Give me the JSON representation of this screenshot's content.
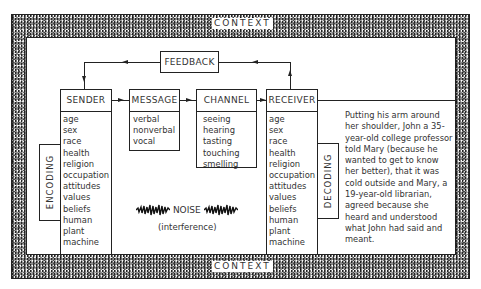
{
  "context": {
    "top_label": "CONTEXT",
    "bottom_label": "CONTEXT"
  },
  "feedback": {
    "label": "FEEDBACK"
  },
  "sender": {
    "label": "SENDER",
    "items": [
      "age",
      "sex",
      "race",
      "health",
      "religion",
      "occupation",
      "attitudes",
      "values",
      "beliefs",
      "human",
      "plant",
      "machine"
    ]
  },
  "message": {
    "label": "MESSAGE",
    "items": [
      "verbal",
      "nonverbal",
      "vocal"
    ]
  },
  "channel": {
    "label": "CHANNEL",
    "items": [
      "seeing",
      "hearing",
      "tasting",
      "touching",
      "smelling"
    ]
  },
  "receiver": {
    "label": "RECEIVER",
    "items": [
      "age",
      "sex",
      "race",
      "health",
      "religion",
      "occupation",
      "attitudes",
      "values",
      "beliefs",
      "human",
      "plant",
      "machine"
    ]
  },
  "encoding": {
    "label": "ENCODING"
  },
  "decoding": {
    "label": "DECODING"
  },
  "noise": {
    "label": "NOISE",
    "sublabel": "(interference)"
  },
  "example": {
    "text": "Putting his arm around her shoulder, John a 35-year-old college professor told Mary (because he wanted to get to know her better), that it was cold outside and Mary, a 19-year-old librarian, agreed because she heard and understood what John had said and meant."
  }
}
